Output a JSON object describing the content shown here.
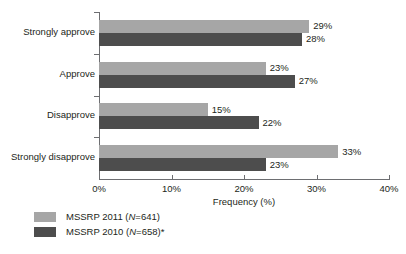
{
  "chart_data": {
    "type": "bar",
    "orientation": "horizontal",
    "title": "",
    "xlabel": "Frequency (%)",
    "ylabel": "",
    "xlim": [
      0,
      40
    ],
    "xticks": [
      "0%",
      "10%",
      "20%",
      "30%",
      "40%"
    ],
    "grid": false,
    "legend_position": "bottom-left",
    "categories": [
      "Strongly approve",
      "Approve",
      "Disapprove",
      "Strongly disapprove"
    ],
    "series": [
      {
        "name": "MSSRP 2011 (N=641)",
        "name_prefix": "MSSRP 2011 (",
        "name_italic": "N",
        "name_suffix": "=641)",
        "color": "#a6a6a6",
        "values": [
          29,
          23,
          15,
          33
        ],
        "labels": [
          "29%",
          "23%",
          "15%",
          "33%"
        ]
      },
      {
        "name": "MSSRP 2010 (N=658)*",
        "name_prefix": "MSSRP 2010 (",
        "name_italic": "N",
        "name_suffix": "=658)*",
        "color": "#4d4d4d",
        "values": [
          28,
          27,
          22,
          23
        ],
        "labels": [
          "28%",
          "27%",
          "22%",
          "23%"
        ]
      }
    ],
    "axis_color": "#6d6e71"
  }
}
